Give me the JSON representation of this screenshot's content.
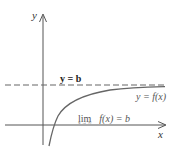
{
  "diagram": {
    "axes": {
      "x_label": "x",
      "y_label": "y"
    },
    "asymptote": {
      "label": "y = b",
      "style": "dashed"
    },
    "curve": {
      "label": "y = f(x)"
    },
    "limit": {
      "lim": "lim",
      "expression": "f(x) = b",
      "subscript": "x → ∞"
    },
    "colors": {
      "axis": "#555555",
      "curve": "#666666",
      "asymptote": "#666666",
      "text": "#333333"
    }
  }
}
